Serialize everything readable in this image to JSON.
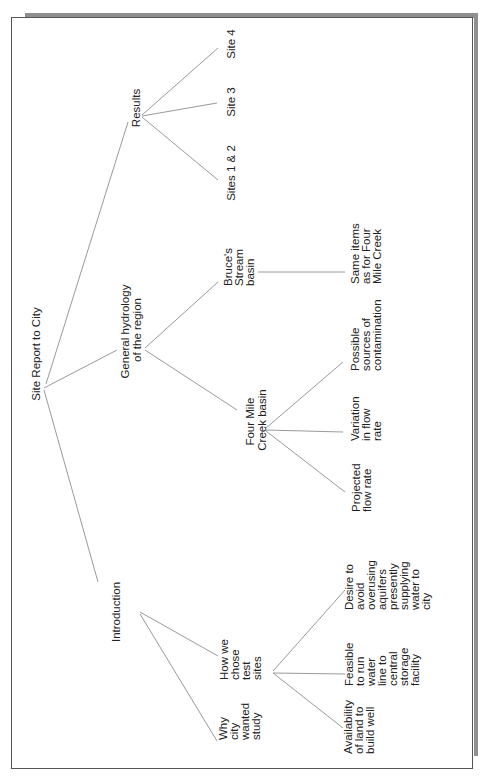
{
  "diagram": {
    "type": "tree",
    "orientation": "rotated -90deg (reads bottom-to-top)",
    "colors": {
      "line": "#9a9a9a",
      "text": "#222222",
      "frame": "#555555",
      "shadow": "#8f8f8f"
    },
    "root": {
      "label": [
        "Site Report to City"
      ]
    },
    "nodes": {
      "introduction": {
        "label": [
          "Introduction"
        ]
      },
      "why_city": {
        "label": [
          "Why",
          "city",
          "wanted",
          "study"
        ]
      },
      "how_chose": {
        "label": [
          "How we",
          "chose",
          "test",
          "sites"
        ]
      },
      "availability": {
        "label": [
          "Availability",
          "of land to",
          "build well"
        ]
      },
      "feasible": {
        "label": [
          "Feasible",
          "to run",
          "water",
          "line to",
          "central",
          "storage",
          "facility"
        ]
      },
      "desire": {
        "label": [
          "Desire to",
          "avoid",
          "overusing",
          "aquifers",
          "presently",
          "supplying",
          "water to",
          "city"
        ]
      },
      "hydrology": {
        "label": [
          "General hydrology",
          "of the region"
        ]
      },
      "four_mile": {
        "label": [
          "Four Mile",
          "Creek basin"
        ]
      },
      "projected": {
        "label": [
          "Projected",
          "flow rate"
        ]
      },
      "variation": {
        "label": [
          "Variation",
          "in flow",
          "rate"
        ]
      },
      "possible": {
        "label": [
          "Possible",
          "sources of",
          "contamination"
        ]
      },
      "bruces": {
        "label": [
          "Bruce's",
          "Stream",
          "basin"
        ]
      },
      "same_items": {
        "label": [
          "Same items",
          "as for Four",
          "Mile Creek"
        ]
      },
      "results": {
        "label": [
          "Results"
        ]
      },
      "sites12": {
        "label": [
          "Sites 1 & 2"
        ]
      },
      "site3": {
        "label": [
          "Site 3"
        ]
      },
      "site4": {
        "label": [
          "Site 4"
        ]
      }
    },
    "edges": [
      [
        "root",
        "introduction"
      ],
      [
        "root",
        "hydrology"
      ],
      [
        "root",
        "results"
      ],
      [
        "introduction",
        "why_city"
      ],
      [
        "introduction",
        "how_chose"
      ],
      [
        "how_chose",
        "availability"
      ],
      [
        "how_chose",
        "feasible"
      ],
      [
        "how_chose",
        "desire"
      ],
      [
        "hydrology",
        "four_mile"
      ],
      [
        "hydrology",
        "bruces"
      ],
      [
        "four_mile",
        "projected"
      ],
      [
        "four_mile",
        "variation"
      ],
      [
        "four_mile",
        "possible"
      ],
      [
        "bruces",
        "same_items"
      ],
      [
        "results",
        "sites12"
      ],
      [
        "results",
        "site3"
      ],
      [
        "results",
        "site4"
      ]
    ]
  }
}
